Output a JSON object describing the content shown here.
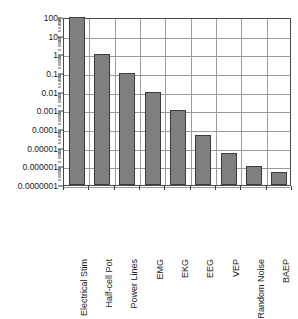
{
  "chart_data": {
    "type": "bar",
    "title": "",
    "subtitle": "",
    "xlabel": "",
    "ylabel": "",
    "yscale": "log",
    "ylim": [
      1e-07,
      100
    ],
    "grid": true,
    "legend": null,
    "orientation": "vertical",
    "bar_color": "#7f7f7f",
    "bar_edge_color": "#3d3d3d",
    "grid_color": "#9b9b9b",
    "frame_color": "#4a4a4a",
    "categories": [
      "Electrical Stim",
      "Half-cell Pot",
      "Power Lines",
      "EMG",
      "EKG",
      "EEG",
      "VEP",
      "Random Noise",
      "BAEP"
    ],
    "values": [
      100,
      1,
      0.1,
      0.01,
      0.001,
      5e-05,
      5e-06,
      1e-06,
      5e-07
    ],
    "ytick_labels": [
      "100",
      "10",
      "1",
      "0.1",
      "0.01",
      "0.001",
      "0.0001",
      "0.00001",
      "0.000001",
      "0.0000001"
    ],
    "ytick_values": [
      100,
      10,
      1,
      0.1,
      0.01,
      0.001,
      0.0001,
      1e-05,
      1e-06,
      1e-07
    ]
  }
}
